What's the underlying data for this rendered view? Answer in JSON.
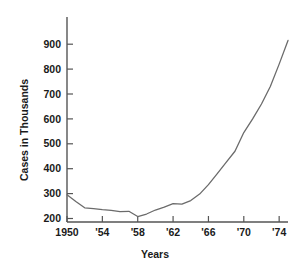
{
  "chart_data": {
    "type": "line",
    "title": "",
    "xlabel": "Years",
    "ylabel": "Cases in Thousands",
    "xlim": [
      1950,
      1975
    ],
    "ylim": [
      150,
      920
    ],
    "grid": false,
    "legend": "none",
    "line_color": "#6b6b6b",
    "axis_color": "#555555",
    "x_tick_labels": [
      "1950",
      "'54",
      "'58",
      "'62",
      "'66",
      "'70",
      "'74"
    ],
    "x_tick_values": [
      1950,
      1954,
      1958,
      1962,
      1966,
      1970,
      1974
    ],
    "y_tick_labels": [
      "200",
      "300",
      "400",
      "500",
      "600",
      "700",
      "800",
      "900"
    ],
    "y_tick_values": [
      200,
      300,
      400,
      500,
      600,
      700,
      800,
      900
    ],
    "x": [
      1950,
      1951,
      1952,
      1953,
      1954,
      1955,
      1956,
      1957,
      1958,
      1959,
      1960,
      1961,
      1962,
      1963,
      1964,
      1965,
      1966,
      1967,
      1968,
      1969,
      1970,
      1971,
      1972,
      1973,
      1974,
      1975
    ],
    "values": [
      295,
      268,
      243,
      240,
      236,
      233,
      228,
      229,
      208,
      218,
      234,
      246,
      260,
      258,
      272,
      298,
      336,
      380,
      425,
      470,
      545,
      600,
      660,
      730,
      820,
      915
    ],
    "series": [
      {
        "name": "Cases",
        "values": [
          295,
          268,
          243,
          240,
          236,
          233,
          228,
          229,
          208,
          218,
          234,
          246,
          260,
          258,
          272,
          298,
          336,
          380,
          425,
          470,
          545,
          600,
          660,
          730,
          820,
          915
        ]
      }
    ]
  },
  "axes": {
    "y_title": "Cases in Thousands",
    "x_title": "Years"
  }
}
